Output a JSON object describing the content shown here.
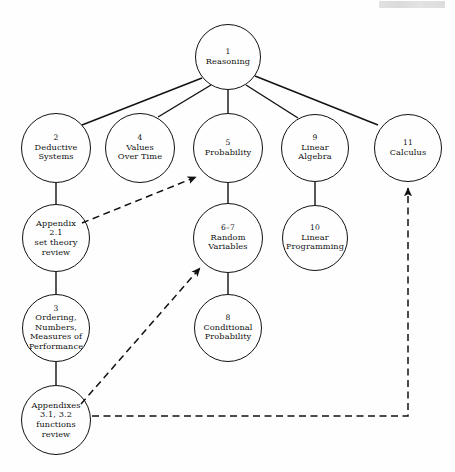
{
  "header": {
    "running_head": ""
  },
  "diagram": {
    "stroke_color": "#111111",
    "background_color": "#fefefe",
    "nodes": [
      {
        "id": "reasoning",
        "number": "1",
        "lines": [
          "Reasoning"
        ],
        "cx": 228,
        "cy": 57,
        "r": 33
      },
      {
        "id": "deductive",
        "number": "2",
        "lines": [
          "Deductive",
          "Systems"
        ],
        "cx": 56,
        "cy": 148,
        "r": 35
      },
      {
        "id": "values-over-time",
        "number": "4",
        "lines": [
          "Values",
          "Over Time"
        ],
        "cx": 140,
        "cy": 148,
        "r": 35
      },
      {
        "id": "probability",
        "number": "5",
        "lines": [
          "Probability"
        ],
        "cx": 228,
        "cy": 148,
        "r": 35
      },
      {
        "id": "linear-algebra",
        "number": "9",
        "lines": [
          "Linear",
          "Algebra"
        ],
        "cx": 315,
        "cy": 148,
        "r": 34
      },
      {
        "id": "calculus",
        "number": "11",
        "lines": [
          "Calculus"
        ],
        "cx": 408,
        "cy": 148,
        "r": 34
      },
      {
        "id": "appendix-2-1",
        "number": "",
        "lines": [
          "Appendix",
          "2.1",
          "set theory",
          "review"
        ],
        "cx": 56,
        "cy": 238,
        "r": 34
      },
      {
        "id": "random-variables",
        "number": "6–7",
        "lines": [
          "Random",
          "Variables"
        ],
        "cx": 228,
        "cy": 238,
        "r": 35
      },
      {
        "id": "linear-prog",
        "number": "10",
        "lines": [
          "Linear",
          "Programming"
        ],
        "cx": 315,
        "cy": 238,
        "r": 33
      },
      {
        "id": "ordering",
        "number": "3",
        "lines": [
          "Ordering,",
          "Numbers,",
          "Measures of",
          "Performance"
        ],
        "cx": 56,
        "cy": 328,
        "r": 34
      },
      {
        "id": "conditional",
        "number": "8",
        "lines": [
          "Conditional",
          "Probability"
        ],
        "cx": 228,
        "cy": 328,
        "r": 34
      },
      {
        "id": "appendixes",
        "number": "",
        "lines": [
          "Appendixes",
          "3.1, 3.2",
          "functions",
          "review"
        ],
        "cx": 56,
        "cy": 420,
        "r": 35
      }
    ],
    "edges": [
      {
        "id": "reasoning-deductive",
        "from": "reasoning",
        "to": "deductive",
        "style": "solid",
        "arrow": false,
        "path": "M 202 78 L 82 125"
      },
      {
        "id": "reasoning-values",
        "from": "reasoning",
        "to": "values-over-time",
        "style": "solid",
        "arrow": false,
        "path": "M 211 85 L 158 117"
      },
      {
        "id": "reasoning-probability",
        "from": "reasoning",
        "to": "probability",
        "style": "solid",
        "arrow": false,
        "path": "M 228 90 L 228 113"
      },
      {
        "id": "reasoning-linear-algebra",
        "from": "reasoning",
        "to": "linear-algebra",
        "style": "solid",
        "arrow": false,
        "path": "M 246 85 L 298 118"
      },
      {
        "id": "reasoning-calculus",
        "from": "reasoning",
        "to": "calculus",
        "style": "solid",
        "arrow": false,
        "path": "M 255 76 L 378 125"
      },
      {
        "id": "deductive-appendix21",
        "from": "deductive",
        "to": "appendix-2-1",
        "style": "solid",
        "arrow": false,
        "path": "M 56 183 L 56 204"
      },
      {
        "id": "appendix21-ordering",
        "from": "appendix-2-1",
        "to": "ordering",
        "style": "solid",
        "arrow": false,
        "path": "M 56 272 L 56 294"
      },
      {
        "id": "ordering-appendixes",
        "from": "ordering",
        "to": "appendixes",
        "style": "solid",
        "arrow": false,
        "path": "M 56 362 L 56 385"
      },
      {
        "id": "probability-random",
        "from": "probability",
        "to": "random-variables",
        "style": "solid",
        "arrow": false,
        "path": "M 228 183 L 228 203"
      },
      {
        "id": "random-conditional",
        "from": "random-variables",
        "to": "conditional",
        "style": "solid",
        "arrow": false,
        "path": "M 228 273 L 228 294"
      },
      {
        "id": "linear-algebra-linear-prog",
        "from": "linear-algebra",
        "to": "linear-prog",
        "style": "solid",
        "arrow": false,
        "path": "M 315 182 L 315 205"
      },
      {
        "id": "appendix21-probability",
        "from": "appendix-2-1",
        "to": "probability",
        "style": "dashed",
        "arrow": true,
        "path": "M 82 223 L 196 177"
      },
      {
        "id": "appendixes-random",
        "from": "appendixes",
        "to": "random-variables",
        "style": "dashed",
        "arrow": true,
        "path": "M 81 404 L 200 268"
      },
      {
        "id": "appendixes-calculus",
        "from": "appendixes",
        "to": "calculus",
        "style": "dashed",
        "arrow": true,
        "path": "M 92 416 L 408 416 L 408 188"
      }
    ]
  }
}
